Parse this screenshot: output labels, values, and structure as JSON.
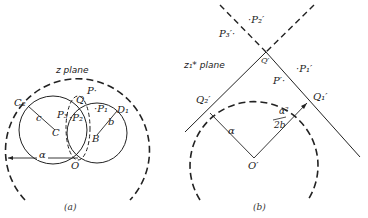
{
  "panel_a": {
    "plane_label": "z plane",
    "caption": "(a)",
    "labels": {
      "C2": "C₂",
      "c": "c",
      "C": "C",
      "P3": "P₃",
      "P2": "·P₂",
      "P": "P·",
      "P1": "·P₁",
      "b": "b",
      "B": "B",
      "D1": "D₁",
      "Q": "Q",
      "O": "O",
      "alpha": "α"
    }
  },
  "panel_b": {
    "plane_label": "z₁* plane",
    "caption": "(b)",
    "labels": {
      "P2p": "·P₂′",
      "P3p": "P₃′·",
      "Qp": "Q′",
      "P1p": "·P₁′",
      "Pp": "P′·",
      "Q2p": "Q₂′",
      "Q1p": "Q₁′",
      "alpha": "α",
      "alpha2": "α²",
      "twob": "2b",
      "Op": "O′"
    }
  },
  "colors": {
    "ink": "#222222",
    "background": "#ffffff"
  }
}
